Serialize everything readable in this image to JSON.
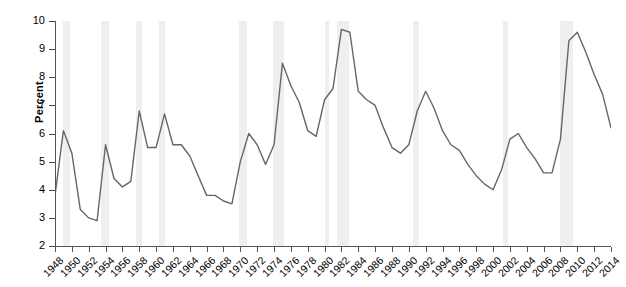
{
  "chart_data": {
    "type": "line",
    "title": "",
    "xlabel": "",
    "ylabel": "Percent",
    "xlim": [
      1948,
      2014
    ],
    "ylim": [
      2,
      10
    ],
    "grid": false,
    "legend": "none",
    "line_color": "#666666",
    "band_color": "#efefef",
    "y_ticks": [
      2,
      3,
      4,
      5,
      6,
      7,
      8,
      9,
      10
    ],
    "x_ticks": [
      1948,
      1950,
      1952,
      1954,
      1956,
      1958,
      1960,
      1962,
      1964,
      1966,
      1968,
      1970,
      1972,
      1974,
      1976,
      1978,
      1980,
      1982,
      1984,
      1986,
      1988,
      1990,
      1992,
      1994,
      1996,
      1998,
      2000,
      2002,
      2004,
      2006,
      2008,
      2010,
      2012,
      2014
    ],
    "x": [
      1948,
      1949,
      1950,
      1951,
      1952,
      1953,
      1954,
      1955,
      1956,
      1957,
      1958,
      1959,
      1960,
      1961,
      1962,
      1963,
      1964,
      1965,
      1966,
      1967,
      1968,
      1969,
      1970,
      1971,
      1972,
      1973,
      1974,
      1975,
      1976,
      1977,
      1978,
      1979,
      1980,
      1981,
      1982,
      1983,
      1984,
      1985,
      1986,
      1987,
      1988,
      1989,
      1990,
      1991,
      1992,
      1993,
      1994,
      1995,
      1996,
      1997,
      1998,
      1999,
      2000,
      2001,
      2002,
      2003,
      2004,
      2005,
      2006,
      2007,
      2008,
      2009,
      2010,
      2011,
      2012,
      2013,
      2014
    ],
    "values": [
      3.8,
      6.1,
      5.3,
      3.3,
      3.0,
      2.9,
      5.6,
      4.4,
      4.1,
      4.3,
      6.8,
      5.5,
      5.5,
      6.7,
      5.6,
      5.6,
      5.2,
      4.5,
      3.8,
      3.8,
      3.6,
      3.5,
      5.0,
      6.0,
      5.6,
      4.9,
      5.6,
      8.5,
      7.7,
      7.1,
      6.1,
      5.9,
      7.2,
      7.6,
      9.7,
      9.6,
      7.5,
      7.2,
      7.0,
      6.2,
      5.5,
      5.3,
      5.6,
      6.8,
      7.5,
      6.9,
      6.1,
      5.6,
      5.4,
      4.9,
      4.5,
      4.2,
      4.0,
      4.7,
      5.8,
      6.0,
      5.5,
      5.1,
      4.6,
      4.6,
      5.8,
      9.3,
      9.6,
      8.9,
      8.1,
      7.4,
      6.2
    ],
    "recession_bands": [
      {
        "start": 1948.9,
        "end": 1949.8
      },
      {
        "start": 1953.5,
        "end": 1954.4
      },
      {
        "start": 1957.6,
        "end": 1958.3
      },
      {
        "start": 1960.3,
        "end": 1961.1
      },
      {
        "start": 1969.9,
        "end": 1970.8
      },
      {
        "start": 1973.9,
        "end": 1975.2
      },
      {
        "start": 1980.0,
        "end": 1980.5
      },
      {
        "start": 1981.5,
        "end": 1982.9
      },
      {
        "start": 1990.5,
        "end": 1991.2
      },
      {
        "start": 2001.2,
        "end": 2001.8
      },
      {
        "start": 2007.9,
        "end": 2009.5
      }
    ]
  }
}
